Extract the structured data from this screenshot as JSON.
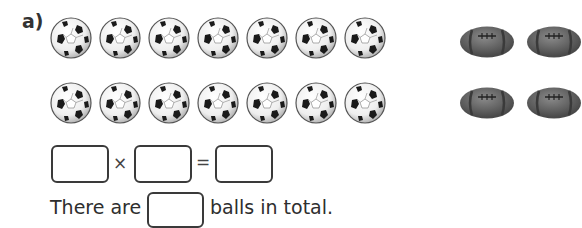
{
  "question": {
    "label": "a)",
    "rows": [
      {
        "icon": "soccer-ball",
        "count": 7
      },
      {
        "icon": "soccer-ball",
        "count": 7
      }
    ],
    "side_images": {
      "icon": "american-football",
      "rows": 2
    },
    "equation": {
      "operator1": "×",
      "operator2": "=",
      "factor1": "",
      "factor2": "",
      "product": ""
    },
    "sentence": {
      "prefix": "There are",
      "answer": "",
      "suffix": "balls in total."
    }
  }
}
